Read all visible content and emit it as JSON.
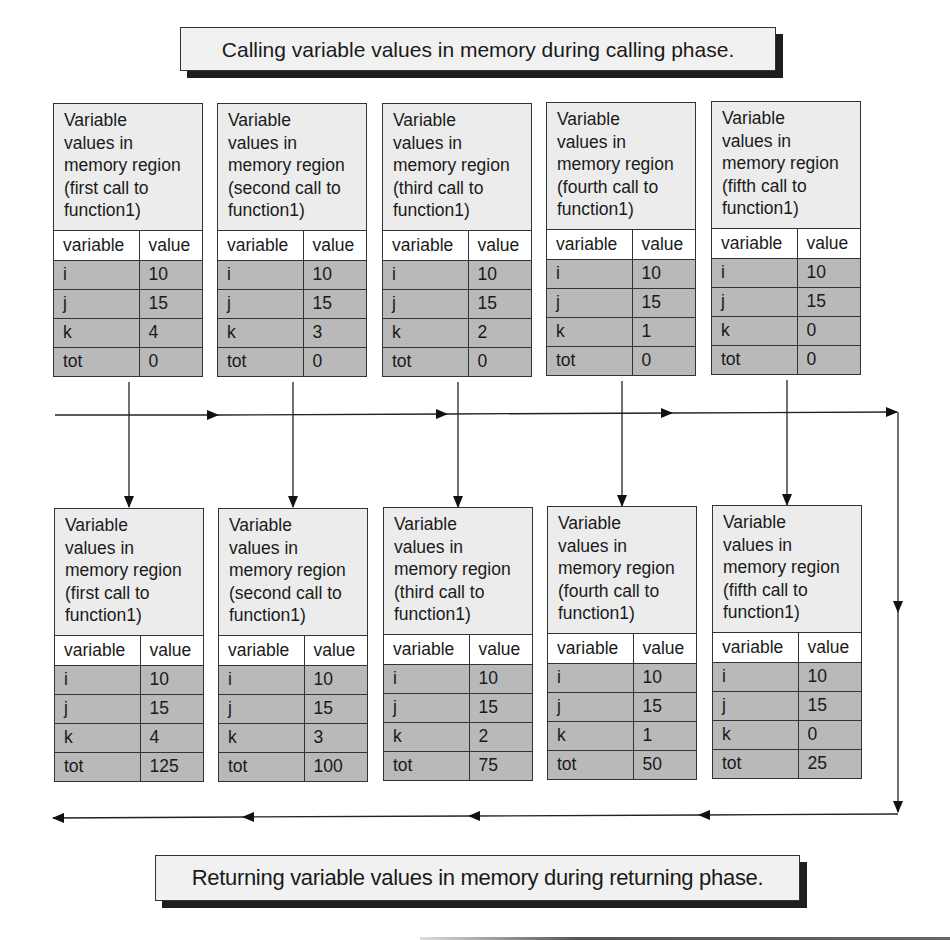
{
  "captions": {
    "calling": "Calling variable values in memory during calling phase.",
    "returning": "Returning variable values in memory during returning phase."
  },
  "table_header": {
    "variable": "variable",
    "value": "value"
  },
  "calling_phase": [
    {
      "title": [
        "Variable",
        "values in",
        "memory region",
        "(first call to",
        "function1)"
      ],
      "rows": [
        {
          "var": "i",
          "val": "10"
        },
        {
          "var": "j",
          "val": "15"
        },
        {
          "var": "k",
          "val": "4"
        },
        {
          "var": "tot",
          "val": "0"
        }
      ]
    },
    {
      "title": [
        "Variable",
        "values in",
        "memory region",
        "(second call to",
        "function1)"
      ],
      "rows": [
        {
          "var": "i",
          "val": "10"
        },
        {
          "var": "j",
          "val": "15"
        },
        {
          "var": "k",
          "val": "3"
        },
        {
          "var": "tot",
          "val": "0"
        }
      ]
    },
    {
      "title": [
        "Variable",
        "values in",
        "memory region",
        "(third call to",
        "function1)"
      ],
      "rows": [
        {
          "var": "i",
          "val": "10"
        },
        {
          "var": "j",
          "val": "15"
        },
        {
          "var": "k",
          "val": "2"
        },
        {
          "var": "tot",
          "val": "0"
        }
      ]
    },
    {
      "title": [
        "Variable",
        "values in",
        "memory region",
        "(fourth call to",
        "function1)"
      ],
      "rows": [
        {
          "var": "i",
          "val": "10"
        },
        {
          "var": "j",
          "val": "15"
        },
        {
          "var": "k",
          "val": "1"
        },
        {
          "var": "tot",
          "val": "0"
        }
      ]
    },
    {
      "title": [
        "Variable",
        "values in",
        "memory region",
        "(fifth call to",
        "function1)"
      ],
      "rows": [
        {
          "var": "i",
          "val": "10"
        },
        {
          "var": "j",
          "val": "15"
        },
        {
          "var": "k",
          "val": "0"
        },
        {
          "var": "tot",
          "val": "0"
        }
      ]
    }
  ],
  "returning_phase": [
    {
      "title": [
        "Variable",
        "values in",
        "memory region",
        "(first call to",
        "function1)"
      ],
      "rows": [
        {
          "var": "i",
          "val": "10"
        },
        {
          "var": "j",
          "val": "15"
        },
        {
          "var": "k",
          "val": "4"
        },
        {
          "var": "tot",
          "val": "125"
        }
      ]
    },
    {
      "title": [
        "Variable",
        "values in",
        "memory region",
        "(second call to",
        "function1)"
      ],
      "rows": [
        {
          "var": "i",
          "val": "10"
        },
        {
          "var": "j",
          "val": "15"
        },
        {
          "var": "k",
          "val": "3"
        },
        {
          "var": "tot",
          "val": "100"
        }
      ]
    },
    {
      "title": [
        "Variable",
        "values in",
        "memory region",
        "(third call to",
        "function1)"
      ],
      "rows": [
        {
          "var": "i",
          "val": "10"
        },
        {
          "var": "j",
          "val": "15"
        },
        {
          "var": "k",
          "val": "2"
        },
        {
          "var": "tot",
          "val": "75"
        }
      ]
    },
    {
      "title": [
        "Variable",
        "values in",
        "memory region",
        "(fourth call to",
        "function1)"
      ],
      "rows": [
        {
          "var": "i",
          "val": "10"
        },
        {
          "var": "j",
          "val": "15"
        },
        {
          "var": "k",
          "val": "1"
        },
        {
          "var": "tot",
          "val": "50"
        }
      ]
    },
    {
      "title": [
        "Variable",
        "values in",
        "memory region",
        "(fifth call to",
        "function1)"
      ],
      "rows": [
        {
          "var": "i",
          "val": "10"
        },
        {
          "var": "j",
          "val": "15"
        },
        {
          "var": "k",
          "val": "0"
        },
        {
          "var": "tot",
          "val": "25"
        }
      ]
    }
  ],
  "colors": {
    "header_fill": "#ececec",
    "data_row_fill": "#b9b9b9",
    "line": "#222222",
    "caption_shadow": "#1e1e1e"
  }
}
